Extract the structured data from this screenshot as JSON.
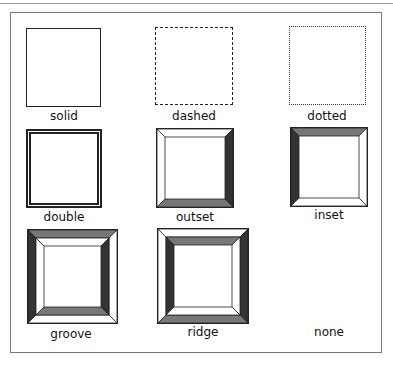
{
  "items": [
    {
      "label": "solid",
      "style": "solid"
    },
    {
      "label": "dashed",
      "style": "dashed"
    },
    {
      "label": "dotted",
      "style": "dotted"
    },
    {
      "label": "double",
      "style": "double"
    },
    {
      "label": "outset",
      "style": "outset"
    },
    {
      "label": "inset",
      "style": "inset"
    },
    {
      "label": "groove",
      "style": "groove"
    },
    {
      "label": "ridge",
      "style": "ridge"
    },
    {
      "label": "none",
      "style": "none"
    }
  ],
  "colors": {
    "border": "#222222",
    "dark": "#333333",
    "mid": "#777777",
    "light": "#ffffff"
  }
}
